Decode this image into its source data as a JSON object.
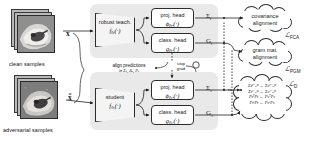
{
  "figure": {
    "type": "architecture-diagram"
  },
  "inputs": [
    {
      "id": "clean",
      "caption": "clean samples",
      "symbol": "x",
      "icon": "image-stack-icon"
    },
    {
      "id": "adversarial",
      "caption": "adversarial samples",
      "symbol": "x̃",
      "icon": "image-stack-icon"
    }
  ],
  "branches": {
    "teacher": {
      "encoder_label": "robust teach.",
      "encoder_fn": "f",
      "encoder_sub": "θt",
      "encoder_arg": "(·)",
      "heads": [
        {
          "id": "proj",
          "label": "proj. head",
          "fn": "ϕ",
          "sub": "θtᵖ",
          "arg": "(·)",
          "out": "Σ",
          "out_sub": "t"
        },
        {
          "id": "class",
          "label": "class. head",
          "fn": "g",
          "sub": "θtᶜ",
          "arg": "(·)",
          "out": "G",
          "out_sub": "t"
        }
      ]
    },
    "student": {
      "encoder_label": "student",
      "encoder_fn": "f",
      "encoder_sub": "θs",
      "encoder_arg": "(·)",
      "heads": [
        {
          "id": "proj",
          "label": "proj. head",
          "fn": "ϕ",
          "sub": "θsᵖ",
          "arg": "(·)",
          "out": "Σ",
          "out_sub": "s"
        },
        {
          "id": "class",
          "label": "class. head",
          "fn": "g",
          "sub": "θsᶜ",
          "arg": "(·)",
          "out": "G",
          "out_sub": "s"
        }
      ]
    }
  },
  "annotations": {
    "align_predictions": "align predictions",
    "align_predictions_math": "in Σₛ, Δₛ, Pₛ",
    "stop_grad_line1": "stop",
    "stop_grad_line2": "grad"
  },
  "objectives": [
    {
      "id": "fca",
      "cloud_line1": "covariance",
      "cloud_line2": "alignment",
      "loss": "ℒ",
      "loss_sub": "FCA"
    },
    {
      "id": "pgm",
      "cloud_line1": "gram mat.",
      "cloud_line2": "alignment",
      "loss": "ℒ",
      "loss_sub": "PGM"
    },
    {
      "id": "distill",
      "cloud_line1": "",
      "cloud_line2": "",
      "loss": "ℒ",
      "loss_sub": "D"
    }
  ],
  "distillation_equations": [
    "Σtᵖ⁻ₒᵘᵗ ← Σsᵖ⁻ₒᵘᵗ",
    "Σtᶜ⁻ₒᵘᵗ ← Σsᶜ⁻ₒᵘᵗ",
    "PtᵀPt ← PsᵀPs",
    "PtᶜPt ← PsᶜPs"
  ],
  "colors": {
    "panel_bg": "#e9e9e9",
    "box_bg": "#ffffff",
    "stroke": "#2c2c2c",
    "photo_bg": "#8d8d8d",
    "page_bg": "#ffffff"
  }
}
